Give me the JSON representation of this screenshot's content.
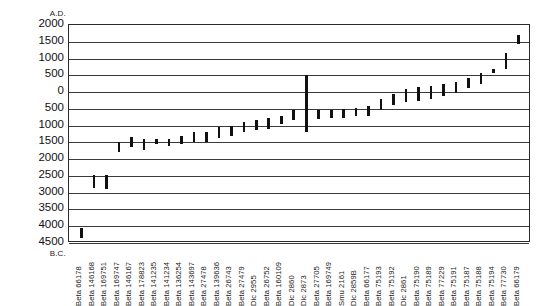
{
  "chart_data": {
    "type": "bar",
    "title": "",
    "xlabel": "",
    "ylabel": "",
    "axis_top_caption": "A.D.",
    "axis_bottom_caption": "B.C.",
    "grid": true,
    "legend": "none",
    "ylim_ad": 2000,
    "ylim_bc": 4500,
    "ytick_labels": [
      "2000",
      "1500",
      "1000",
      "500",
      "0",
      "500",
      "1000",
      "1500",
      "2000",
      "2500",
      "3000",
      "3500",
      "4000",
      "4500"
    ],
    "ytick_values": [
      2000,
      1500,
      1000,
      500,
      0,
      -500,
      -1000,
      -1500,
      -2000,
      -2500,
      -3000,
      -3500,
      -4000,
      -4500
    ],
    "categories": [
      "Beta 66178",
      "Beta 146168",
      "Beta 169751",
      "Beta 169747",
      "Beta 146167",
      "Beta 178823",
      "Beta 141235",
      "Beta 141234",
      "Beta 136254",
      "Beta 143697",
      "Beta 27478",
      "Beta 139636",
      "Beta 26743",
      "Beta 27479",
      "Dic 2955",
      "Beta 26752",
      "Beta 160109",
      "Dic 2860",
      "Dic 2873",
      "Beta 27705",
      "Beta 169749",
      "Smu 2161",
      "Dic 2859B",
      "Beta 66177",
      "Beta 75193",
      "Beta 75192",
      "Dic 2861",
      "Beta 75190",
      "Beta 75189",
      "Beta 77229",
      "Beta 75191",
      "Beta 75187",
      "Beta 75188",
      "Beta 75194",
      "Beta 77730",
      "Beta 66179"
    ],
    "series": [
      {
        "name": "calibrated date range",
        "ranges_bc_ad": [
          {
            "label": "Beta 66178",
            "low": -4350,
            "high": -4040
          },
          {
            "label": "Beta 146168",
            "low": -2860,
            "high": -2460
          },
          {
            "label": "Beta 169751",
            "low": -2880,
            "high": -2460
          },
          {
            "label": "Beta 169747",
            "low": -1780,
            "high": -1480
          },
          {
            "label": "Beta 146167",
            "low": -1640,
            "high": -1330
          },
          {
            "label": "Beta 178823",
            "low": -1720,
            "high": -1400
          },
          {
            "label": "Beta 141235",
            "low": -1560,
            "high": -1400
          },
          {
            "label": "Beta 141234",
            "low": -1600,
            "high": -1400
          },
          {
            "label": "Beta 136254",
            "low": -1560,
            "high": -1320
          },
          {
            "label": "Beta 143697",
            "low": -1480,
            "high": -1200
          },
          {
            "label": "Beta 27478",
            "low": -1480,
            "high": -1180
          },
          {
            "label": "Beta 139636",
            "low": -1380,
            "high": -1040
          },
          {
            "label": "Beta 26743",
            "low": -1320,
            "high": -1020
          },
          {
            "label": "Beta 27479",
            "low": -1180,
            "high": -900
          },
          {
            "label": "Dic 2955",
            "low": -1120,
            "high": -840
          },
          {
            "label": "Beta 26752",
            "low": -1100,
            "high": -760
          },
          {
            "label": "Beta 160109",
            "low": -960,
            "high": -700
          },
          {
            "label": "Dic 2860",
            "low": -840,
            "high": -520
          },
          {
            "label": "Dic 2873",
            "low": -1200,
            "high": 500
          },
          {
            "label": "Beta 27705",
            "low": -800,
            "high": -520
          },
          {
            "label": "Beta 169749",
            "low": -780,
            "high": -540
          },
          {
            "label": "Smu 2161",
            "low": -760,
            "high": -500
          },
          {
            "label": "Dic 2859B",
            "low": -720,
            "high": -480
          },
          {
            "label": "Beta 66177",
            "low": -700,
            "high": -420
          },
          {
            "label": "Beta 75193",
            "low": -540,
            "high": -220
          },
          {
            "label": "Beta 75192",
            "low": -380,
            "high": -60
          },
          {
            "label": "Dic 2861",
            "low": -300,
            "high": 100
          },
          {
            "label": "Beta 75190",
            "low": -260,
            "high": 140
          },
          {
            "label": "Beta 75189",
            "low": -200,
            "high": 180
          },
          {
            "label": "Beta 77229",
            "low": -120,
            "high": 240
          },
          {
            "label": "Beta 75191",
            "low": -20,
            "high": 300
          },
          {
            "label": "Beta 75187",
            "low": 120,
            "high": 420
          },
          {
            "label": "Beta 75188",
            "low": 240,
            "high": 560
          },
          {
            "label": "Beta 75194",
            "low": 560,
            "high": 700
          },
          {
            "label": "Beta 77730",
            "low": 700,
            "high": 1180
          },
          {
            "label": "Beta 66179",
            "low": 1420,
            "high": 1700
          }
        ]
      }
    ]
  },
  "colors": {
    "bar": "#111111",
    "grid": "#3a3a3a",
    "frame": "#2b2b2b",
    "background": "#ffffff",
    "text": "#1a1a1a"
  }
}
